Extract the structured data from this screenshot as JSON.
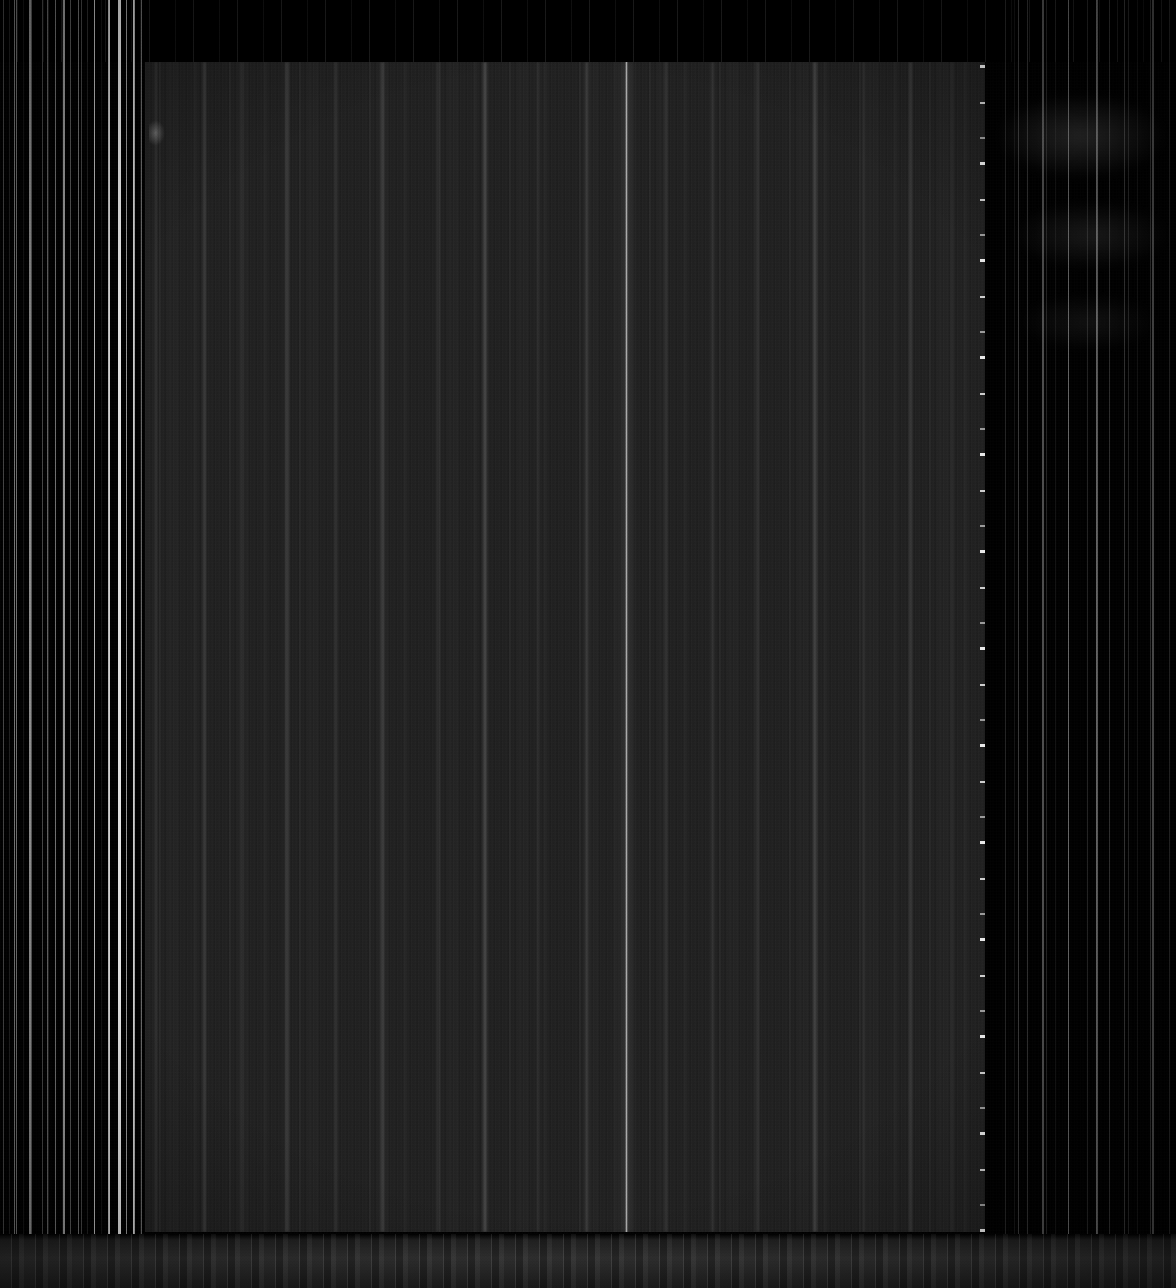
{
  "image": {
    "kind": "raw-detector-frame",
    "description": "Uncalibrated dark sensor readout frame with vertical column streak artifacts",
    "width_px": 1176,
    "height_px": 1288,
    "background_color": "#000000"
  },
  "panel": {
    "name": "detector-active-area",
    "left_px": 145,
    "top_px": 62,
    "width_px": 840,
    "height_px": 1170,
    "fill_color": "#1d1d1d"
  },
  "features": {
    "left_streak_field": {
      "label": "left-readout-streaks",
      "left_px": 0,
      "width_px": 148,
      "color": "#e6e6e6"
    },
    "right_streak_field": {
      "label": "right-readout-streaks",
      "left_px": 1000,
      "width_px": 176,
      "color": "#bebebe"
    },
    "bright_column": {
      "label": "bright-scan-column",
      "x_px": 625,
      "width_px": 3,
      "color": "#ffffff"
    },
    "edge_speckle": {
      "label": "hot-pixel-edge",
      "x_px": 983,
      "width_px": 5,
      "color": "#ffffff"
    },
    "right_glow": {
      "label": "diffuse-glow",
      "left_px": 1000,
      "top_px": 70,
      "width_px": 176,
      "height_px": 300,
      "color": "#ffffff"
    },
    "bottom_bleed": {
      "label": "bottom-bleed-band",
      "top_px": 1234,
      "height_px": 54,
      "color": "#3e3e3e"
    },
    "top_strip": {
      "label": "top-dark-strip",
      "top_px": 0,
      "height_px": 62,
      "color": "#000000"
    }
  },
  "hot_columns_left": [
    {
      "x_px": 14,
      "width_px": 1,
      "opacity": 0.45
    },
    {
      "x_px": 29,
      "width_px": 2,
      "opacity": 0.55
    },
    {
      "x_px": 47,
      "width_px": 1,
      "opacity": 0.38
    },
    {
      "x_px": 63,
      "width_px": 2,
      "opacity": 0.6
    },
    {
      "x_px": 78,
      "width_px": 1,
      "opacity": 0.42
    },
    {
      "x_px": 94,
      "width_px": 1,
      "opacity": 0.5
    },
    {
      "x_px": 108,
      "width_px": 2,
      "opacity": 0.72
    },
    {
      "x_px": 118,
      "width_px": 3,
      "opacity": 0.88
    },
    {
      "x_px": 126,
      "width_px": 1,
      "opacity": 0.52
    },
    {
      "x_px": 133,
      "width_px": 2,
      "opacity": 0.66
    },
    {
      "x_px": 141,
      "width_px": 1,
      "opacity": 0.4
    }
  ],
  "panel_bands": [
    {
      "x_px": 10,
      "width_px": 2,
      "opacity": 0.1
    },
    {
      "x_px": 58,
      "width_px": 3,
      "opacity": 0.13
    },
    {
      "x_px": 96,
      "width_px": 2,
      "opacity": 0.09
    },
    {
      "x_px": 140,
      "width_px": 4,
      "opacity": 0.12
    },
    {
      "x_px": 190,
      "width_px": 2,
      "opacity": 0.08
    },
    {
      "x_px": 236,
      "width_px": 3,
      "opacity": 0.14
    },
    {
      "x_px": 292,
      "width_px": 2,
      "opacity": 0.1
    },
    {
      "x_px": 338,
      "width_px": 4,
      "opacity": 0.16
    },
    {
      "x_px": 392,
      "width_px": 2,
      "opacity": 0.09
    },
    {
      "x_px": 440,
      "width_px": 3,
      "opacity": 0.13
    },
    {
      "x_px": 520,
      "width_px": 2,
      "opacity": 0.11
    },
    {
      "x_px": 566,
      "width_px": 3,
      "opacity": 0.09
    },
    {
      "x_px": 612,
      "width_px": 2,
      "opacity": 0.12
    },
    {
      "x_px": 668,
      "width_px": 4,
      "opacity": 0.15
    },
    {
      "x_px": 718,
      "width_px": 2,
      "opacity": 0.1
    },
    {
      "x_px": 764,
      "width_px": 3,
      "opacity": 0.12
    },
    {
      "x_px": 806,
      "width_px": 2,
      "opacity": 0.08
    }
  ],
  "hot_columns_right": [
    {
      "x_px": 1018,
      "width_px": 1,
      "opacity": 0.22
    },
    {
      "x_px": 1042,
      "width_px": 2,
      "opacity": 0.3
    },
    {
      "x_px": 1068,
      "width_px": 1,
      "opacity": 0.25
    },
    {
      "x_px": 1096,
      "width_px": 2,
      "opacity": 0.34
    },
    {
      "x_px": 1124,
      "width_px": 1,
      "opacity": 0.2
    },
    {
      "x_px": 1152,
      "width_px": 2,
      "opacity": 0.28
    }
  ],
  "accessibility": {
    "alt_text": "Very dark raw sensor frame showing a rectangular detector area over a black background with bright vertical streak artifacts."
  }
}
